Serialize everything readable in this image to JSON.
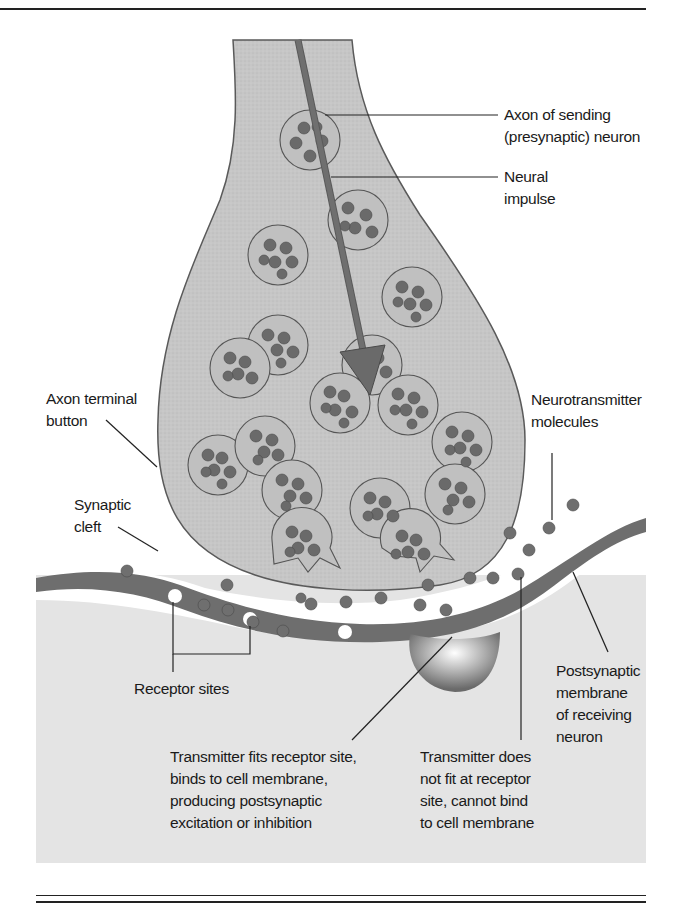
{
  "figure": {
    "colors": {
      "page_background": "#ffffff",
      "panel_background": "#e6e6e6",
      "neuron_fill": "#c4c4c4",
      "neuron_outline": "#5a5a5a",
      "postsynaptic_fill": "#e2e2e2",
      "membrane": "#6e6e6e",
      "vesicle_fill": "#bdbdbd",
      "molecule": "#6f6f6f",
      "impulse_arrow": "#6a6a6a",
      "rules": "#222222"
    },
    "labels": {
      "axon": [
        "Axon of sending",
        "(presynaptic) neuron"
      ],
      "impulse": [
        "Neural",
        "impulse"
      ],
      "terminal": [
        "Axon terminal",
        "button"
      ],
      "neurotransmitter": [
        "Neurotransmitter",
        "molecules"
      ],
      "cleft": [
        "Synaptic",
        "cleft"
      ],
      "receptor": [
        "Receptor sites"
      ],
      "postsynaptic": [
        "Postsynaptic",
        "membrane",
        "of receiving",
        "neuron"
      ],
      "fits": [
        "Transmitter fits receptor site,",
        "binds to cell membrane,",
        "producing postsynaptic",
        "excitation or inhibition"
      ],
      "nofit": [
        "Transmitter does",
        "not fit at receptor",
        "site, cannot bind",
        "to cell membrane"
      ]
    }
  }
}
